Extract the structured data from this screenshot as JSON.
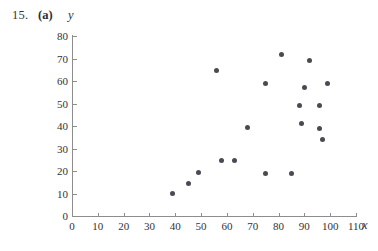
{
  "header": {
    "problem_number": "15.",
    "part_label": "(a)"
  },
  "chart_data": {
    "type": "scatter",
    "title": "",
    "xlabel": "x",
    "ylabel": "y",
    "xlim": [
      0,
      110
    ],
    "ylim": [
      0,
      80
    ],
    "xticks": [
      0,
      10,
      20,
      30,
      40,
      50,
      60,
      70,
      80,
      90,
      100,
      110
    ],
    "yticks": [
      0,
      10,
      20,
      30,
      40,
      50,
      60,
      70,
      80
    ],
    "xtick_labels": [
      "0",
      "10",
      "20",
      "30",
      "40",
      "50",
      "60",
      "70",
      "80",
      "90",
      "100",
      "110"
    ],
    "ytick_labels": [
      "0",
      "10",
      "20",
      "30",
      "40",
      "50",
      "60",
      "70",
      "80"
    ],
    "grid": false,
    "legend": null,
    "marker_color": "#4a4a52",
    "axis_color": "#8d8d8d",
    "points": [
      {
        "x": 39,
        "y": 10
      },
      {
        "x": 45,
        "y": 14.5
      },
      {
        "x": 49,
        "y": 19.5
      },
      {
        "x": 56,
        "y": 64.5
      },
      {
        "x": 58,
        "y": 24.5
      },
      {
        "x": 63,
        "y": 24.5
      },
      {
        "x": 68,
        "y": 39.5
      },
      {
        "x": 75,
        "y": 59
      },
      {
        "x": 75,
        "y": 19
      },
      {
        "x": 81,
        "y": 72
      },
      {
        "x": 85,
        "y": 19
      },
      {
        "x": 88,
        "y": 49
      },
      {
        "x": 89,
        "y": 41
      },
      {
        "x": 90,
        "y": 57
      },
      {
        "x": 92,
        "y": 69
      },
      {
        "x": 96,
        "y": 49
      },
      {
        "x": 96,
        "y": 39
      },
      {
        "x": 97,
        "y": 34
      },
      {
        "x": 99,
        "y": 59
      }
    ]
  }
}
